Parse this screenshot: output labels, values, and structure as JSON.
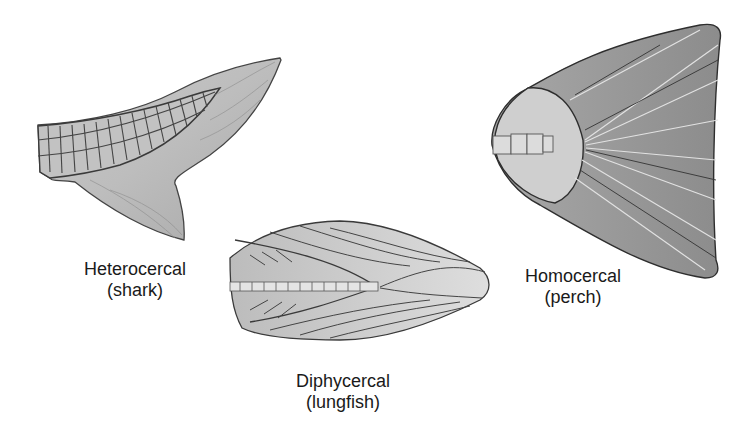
{
  "figure": {
    "tails": [
      {
        "id": "heterocercal",
        "name": "Heterocercal",
        "example": "(shark)"
      },
      {
        "id": "diphycercal",
        "name": "Diphycercal",
        "example": "(lungfish)"
      },
      {
        "id": "homocercal",
        "name": "Homocercal",
        "example": "(perch)"
      }
    ]
  },
  "colors": {
    "background": "#ffffff",
    "fin_fill_light": "#d4d4d4",
    "fin_fill_dark": "#9a9a9a",
    "outline": "#3a3a3a",
    "text": "#1a1a1a"
  }
}
